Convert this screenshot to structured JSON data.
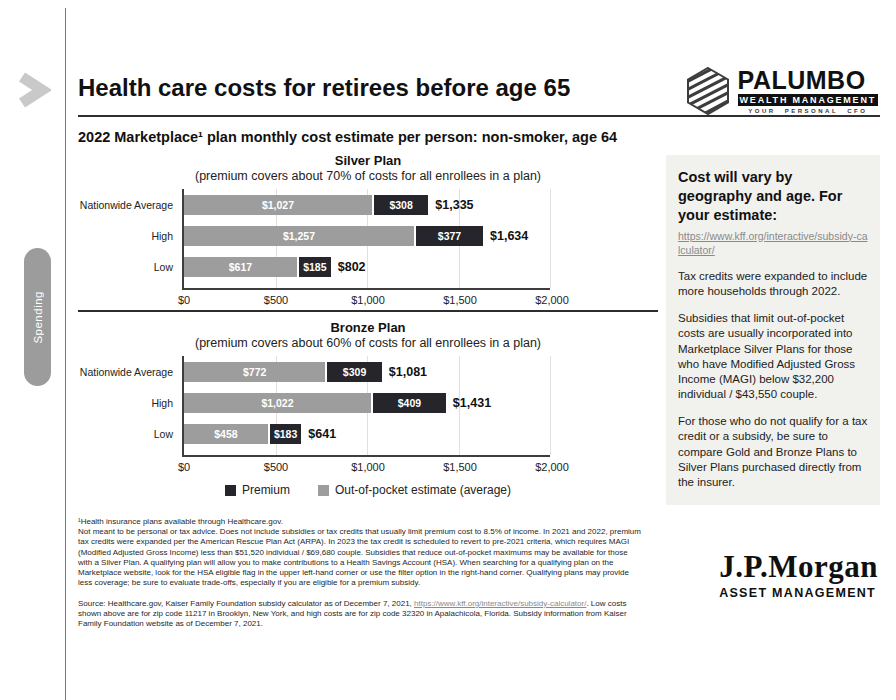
{
  "page": {
    "title": "Health care costs for retirees before age 65",
    "subtitle": "2022 Marketplace¹ plan monthly cost estimate per person: non-smoker, age 64",
    "spending_tab": "Spending"
  },
  "brand": {
    "palumbo": {
      "name": "PALUMBO",
      "bar": "WEALTH MANAGEMENT",
      "tagline": "YOUR PERSONAL CFO"
    },
    "jpmorgan": {
      "name": "J.P.Morgan",
      "division": "ASSET MANAGEMENT"
    }
  },
  "colors": {
    "premium": "#25252b",
    "out_of_pocket": "#9d9d9d",
    "sidebar_bg": "#f1f1ee",
    "link_gray": "#8a8a8a"
  },
  "chart_data": [
    {
      "type": "bar",
      "orientation": "horizontal",
      "title": "Silver Plan",
      "subtitle": "(premium covers about 70% of costs for all enrollees in a plan)",
      "categories": [
        "Nationwide Average",
        "High",
        "Low"
      ],
      "series": [
        {
          "name": "Out-of-pocket estimate (average)",
          "color": "#9d9d9d",
          "values": [
            1027,
            1257,
            617
          ],
          "labels": [
            "$1,027",
            "$1,257",
            "$617"
          ]
        },
        {
          "name": "Premium",
          "color": "#25252b",
          "values": [
            308,
            377,
            185
          ],
          "labels": [
            "$308",
            "$377",
            "$185"
          ]
        }
      ],
      "totals": [
        "$1,335",
        "$1,634",
        "$802"
      ],
      "x_ticks": [
        "$0",
        "$500",
        "$1,000",
        "$1,500",
        "$2,000"
      ],
      "xlim": [
        0,
        2000
      ],
      "grid": true,
      "legend_position": "bottom-shared"
    },
    {
      "type": "bar",
      "orientation": "horizontal",
      "title": "Bronze Plan",
      "subtitle": "(premium covers about 60% of costs for all enrollees in a plan)",
      "categories": [
        "Nationwide Average",
        "High",
        "Low"
      ],
      "series": [
        {
          "name": "Out-of-pocket estimate (average)",
          "color": "#9d9d9d",
          "values": [
            772,
            1022,
            458
          ],
          "labels": [
            "$772",
            "$1,022",
            "$458"
          ]
        },
        {
          "name": "Premium",
          "color": "#25252b",
          "values": [
            309,
            409,
            183
          ],
          "labels": [
            "$309",
            "$409",
            "$183"
          ]
        }
      ],
      "totals": [
        "$1,081",
        "$1,431",
        "$641"
      ],
      "x_ticks": [
        "$0",
        "$500",
        "$1,000",
        "$1,500",
        "$2,000"
      ],
      "xlim": [
        0,
        2000
      ],
      "grid": true,
      "legend_position": "bottom-shared"
    }
  ],
  "legend": {
    "items": [
      {
        "label": "Premium",
        "color": "#25252b"
      },
      {
        "label": "Out-of-pocket estimate (average)",
        "color": "#9d9d9d"
      }
    ]
  },
  "sidebar": {
    "heading": "Cost will vary by geography and age. For your estimate:",
    "link": "https://www.kff.org/interactive/subsidy-calculator/",
    "paragraphs": [
      "Tax credits were expanded to include more households through 2022.",
      "Subsidies that limit out-of-pocket costs are usually incorporated into Marketplace Silver Plans for those who have Modified Adjusted Gross Income (MAGI) below $32,200 individual / $43,550 couple.",
      "For those who do not qualify for a tax credit or a subsidy, be sure to compare Gold and Bronze Plans to Silver Plans purchased directly from the insurer."
    ]
  },
  "footnotes": {
    "line1": "¹Health insurance plans available through Healthcare.gov.",
    "body": "Not meant to be personal or tax advice. Does not include subsidies or tax credits that usually limit premium cost to 8.5% of income. In 2021 and 2022, premium tax credits were expanded per the American Rescue Plan Act (ARPA). In 2023 the tax credit is scheduled to revert to pre-2021 criteria, which requires MAGI (Modified Adjusted Gross Income) less than $51,520 individual / $69,680 couple. Subsidies that reduce out-of-pocket maximums may be available for those with a Silver Plan. A qualifying plan will allow you to make contributions to a Health Savings Account (HSA). When searching for a qualifying plan on the Marketplace website, look for the HSA eligible flag in the upper left-hand corner or use the filter option in the right-hand corner. Qualifying plans may provide less coverage; be sure to evaluate trade-offs, especially if you are eligible for a premium subsidy.",
    "source_prefix": "Source: Healthcare.gov, Kaiser Family Foundation subsidy calculator as of December 7, 2021, ",
    "source_link": "https://www.kff.org/interactive/subsidy-calculator/",
    "source_suffix": ". Low costs shown above are for zip code 11217 in Brooklyn, New York, and high costs are for zip code 32320 in Apalachicola, Florida. Subsidy information from Kaiser Family Foundation website as of December 7, 2021."
  }
}
